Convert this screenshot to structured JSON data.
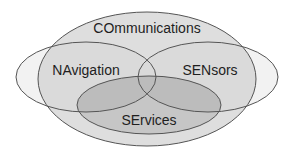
{
  "diagram": {
    "type": "venn",
    "sets": [
      {
        "id": "communications",
        "label": "COmmunications",
        "cx": 147,
        "cy": 79,
        "rx": 109,
        "ry": 67,
        "fill": "#dedede"
      },
      {
        "id": "navigation",
        "label": "NAvigation",
        "cx": 86,
        "cy": 77,
        "rx": 70,
        "ry": 35,
        "fill": "#f2f2f2"
      },
      {
        "id": "sensors",
        "label": "SENsors",
        "cx": 208,
        "cy": 77,
        "rx": 70,
        "ry": 35,
        "fill": "#f2f2f2"
      },
      {
        "id": "services",
        "label": "SErvices",
        "cx": 149,
        "cy": 105,
        "rx": 72,
        "ry": 29,
        "fill": "#c2c2c2"
      }
    ],
    "labels": {
      "communications": "COmmunications",
      "navigation": "NAvigation",
      "sensors": "SENsors",
      "services": "SErvices"
    },
    "colors": {
      "outline": "#555555",
      "text": "#1e1e1e",
      "comm_fill": "#dcdcdc",
      "outer_fill": "#f2f2f2",
      "services_fill": "#c4c4c4"
    }
  }
}
